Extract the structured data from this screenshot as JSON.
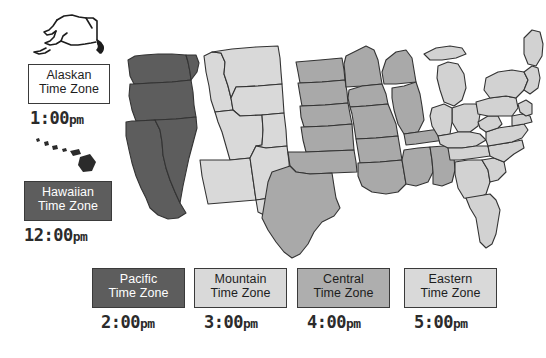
{
  "canvas": {
    "width": 546,
    "height": 358,
    "background": "#ffffff"
  },
  "title_context": "United States Time Zones Map",
  "colors": {
    "pacific_fill": "#5d5d5d",
    "mountain_fill": "#d9d9d9",
    "central_fill": "#a9a9a9",
    "eastern_fill": "#d2d2d2",
    "border_stroke": "#333333",
    "label_dark_bg": "#5d5d5d",
    "label_dark_text": "#ffffff",
    "label_light_bg": "#d9d9d9",
    "label_mid_bg": "#aeaeae",
    "label_white_bg": "#ffffff",
    "label_dark_text_on_light": "#1d1d1d",
    "time_text": "#2b2b2b"
  },
  "insets": {
    "alaska": {
      "name": "alaska-outline",
      "style": "line-sketch",
      "stroke": "#1d1d1d"
    },
    "hawaii": {
      "name": "hawaii-islands",
      "style": "filled-dots",
      "fill": "#2b2b2b"
    }
  },
  "zones": [
    {
      "id": "alaskan",
      "label_line1": "Alaskan",
      "label_line2": "Time Zone",
      "time": "1",
      "time_minutes": ":00",
      "time_suffix": "pm",
      "time_full": "1:00pm",
      "box_style": "white",
      "box": {
        "x": 28,
        "y": 64,
        "w": 82,
        "h": 40
      },
      "time_pos": {
        "x": 30,
        "y": 108
      }
    },
    {
      "id": "hawaiian",
      "label_line1": "Hawaiian",
      "label_line2": "Time Zone",
      "time": "12",
      "time_minutes": ":00",
      "time_suffix": "pm",
      "time_full": "12:00pm",
      "box_style": "dark",
      "box": {
        "x": 24,
        "y": 181,
        "w": 88,
        "h": 40
      },
      "time_pos": {
        "x": 24,
        "y": 225
      }
    },
    {
      "id": "pacific",
      "label_line1": "Pacific",
      "label_line2": "Time Zone",
      "time": "2",
      "time_minutes": ":00",
      "time_suffix": "pm",
      "time_full": "2:00pm",
      "box_style": "dark",
      "box": {
        "x": 92,
        "y": 268,
        "w": 93,
        "h": 40
      },
      "time_pos": {
        "x": 101,
        "y": 312
      }
    },
    {
      "id": "mountain",
      "label_line1": "Mountain",
      "label_line2": "Time Zone",
      "time": "3",
      "time_minutes": ":00",
      "time_suffix": "pm",
      "time_full": "3:00pm",
      "box_style": "light",
      "box": {
        "x": 194,
        "y": 268,
        "w": 93,
        "h": 40
      },
      "time_pos": {
        "x": 204,
        "y": 312
      }
    },
    {
      "id": "central",
      "label_line1": "Central",
      "label_line2": "Time Zone",
      "time": "4",
      "time_minutes": ":00",
      "time_suffix": "pm",
      "time_full": "4:00pm",
      "box_style": "mid",
      "box": {
        "x": 297,
        "y": 268,
        "w": 93,
        "h": 40
      },
      "time_pos": {
        "x": 307,
        "y": 312
      }
    },
    {
      "id": "eastern",
      "label_line1": "Eastern",
      "label_line2": "Time Zone",
      "time": "5",
      "time_minutes": ":00",
      "time_suffix": "pm",
      "time_full": "5:00pm",
      "box_style": "light",
      "box": {
        "x": 404,
        "y": 268,
        "w": 93,
        "h": 40
      },
      "time_pos": {
        "x": 414,
        "y": 312
      }
    }
  ]
}
